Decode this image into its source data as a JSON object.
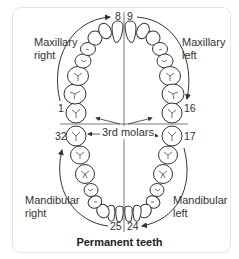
{
  "diagram": {
    "title": "Permanent teeth",
    "quadrants": {
      "maxillary_right": [
        "Maxillary",
        "right"
      ],
      "maxillary_left": [
        "Maxillary",
        "left"
      ],
      "mandibular_right": [
        "Mandibular",
        "right"
      ],
      "mandibular_left": [
        "Mandibular",
        "left"
      ]
    },
    "tooth_numbers": {
      "n1": "1",
      "n8": "8",
      "n9": "9",
      "n16": "16",
      "n17": "17",
      "n24": "24",
      "n25": "25",
      "n32": "32"
    },
    "annotation": "3rd molars",
    "colors": {
      "line": "#333333",
      "tooth_fill": "#ffffff",
      "frame": "#e4e4e4"
    }
  }
}
